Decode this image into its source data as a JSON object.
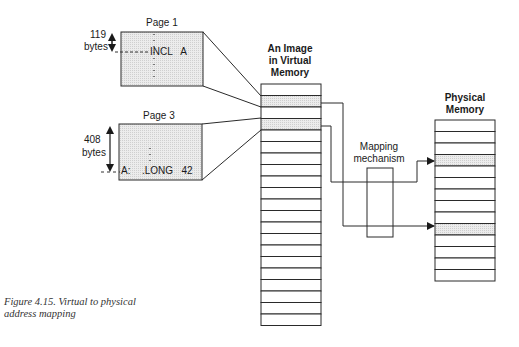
{
  "figure": {
    "caption_line1": "Figure 4.15. Virtual to physical",
    "caption_line2": "address mapping"
  },
  "page1": {
    "title": "Page 1",
    "offset_value": "119",
    "offset_unit": "bytes",
    "instruction": "INCL   A"
  },
  "page3": {
    "title": "Page 3",
    "offset_value": "408",
    "offset_unit": "bytes",
    "label": "A:",
    "instruction": ".LONG   42"
  },
  "virtual_memory": {
    "title_line1": "An Image",
    "title_line2": "in Virtual",
    "title_line3": "Memory",
    "cell_count": 21,
    "shaded_cells": [
      1,
      3
    ]
  },
  "mapping": {
    "label_line1": "Mapping",
    "label_line2": "mechanism"
  },
  "physical_memory": {
    "title_line1": "Physical",
    "title_line2": "Memory",
    "cell_count": 14,
    "shaded_cells": [
      3,
      9
    ]
  },
  "colors": {
    "line": "#2a2a2a",
    "shade": "#e2e2e2"
  }
}
